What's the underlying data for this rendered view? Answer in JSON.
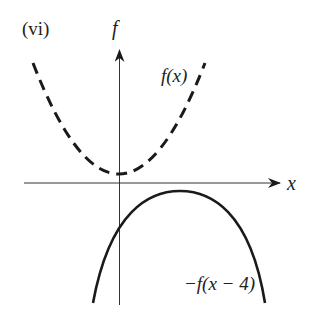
{
  "panel_label": "(vi)",
  "axes": {
    "y_label": "f",
    "x_label": "x"
  },
  "curves": [
    {
      "name": "f(x)",
      "label": "f(x)",
      "style": "dashed",
      "shape": "upward parabola, minimum slightly above x-axis at x=0"
    },
    {
      "name": "-f(x-4)",
      "label": "−f(x − 4)",
      "style": "solid",
      "shape": "downward parabola, maximum slightly below x-axis, shifted right"
    }
  ],
  "colors": {
    "stroke": "#1a1a1a",
    "axis": "#333333",
    "background": "#ffffff"
  }
}
